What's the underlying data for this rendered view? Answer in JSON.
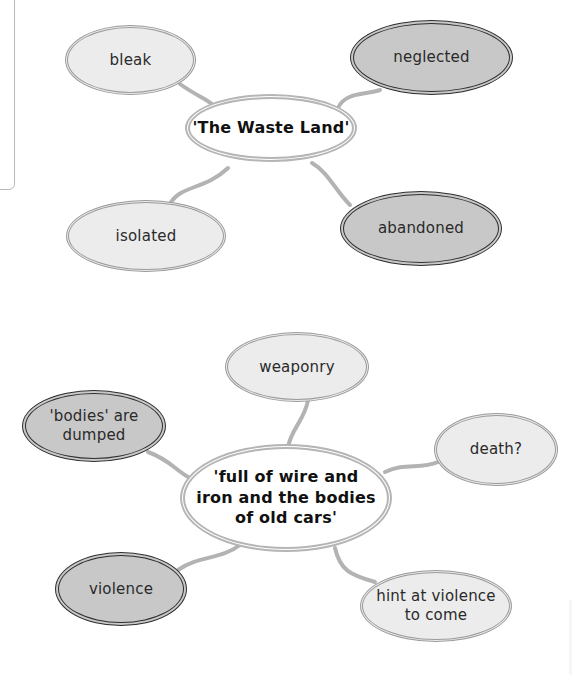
{
  "diagram_top": {
    "type": "mind-map",
    "center": "'The Waste Land'",
    "nodes": [
      {
        "label": "bleak",
        "style": "light"
      },
      {
        "label": "neglected",
        "style": "dark"
      },
      {
        "label": "isolated",
        "style": "light"
      },
      {
        "label": "abandoned",
        "style": "dark"
      }
    ]
  },
  "diagram_bottom": {
    "type": "mind-map",
    "center_lines": [
      "'full of wire and",
      "iron and the bodies",
      "of old cars'"
    ],
    "nodes": [
      {
        "label": "weaponry",
        "style": "light"
      },
      {
        "label_lines": [
          "'bodies' are",
          "dumped"
        ],
        "style": "dark"
      },
      {
        "label": "death?",
        "style": "light"
      },
      {
        "label": "violence",
        "style": "dark"
      },
      {
        "label_lines": [
          "hint at violence",
          "to come"
        ],
        "style": "light"
      }
    ]
  },
  "colors": {
    "light_fill": "#ececec",
    "dark_fill": "#c8c8c8",
    "light_border": "#9a9a9a",
    "dark_border": "#2e2e2e",
    "center_border": "#b5b5b5",
    "connector": "#b0b0b0"
  }
}
